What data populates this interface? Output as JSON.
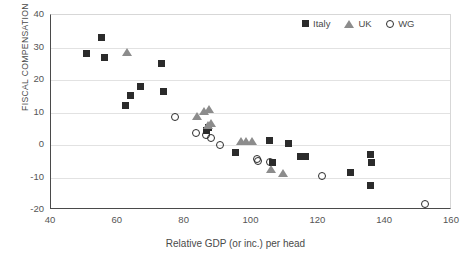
{
  "chart_data": {
    "type": "scatter",
    "title": "",
    "xlabel": "Relative GDP (or inc.) per head",
    "ylabel": "FISCAL COMPENSATION",
    "xlim": [
      40,
      160
    ],
    "ylim": [
      -20,
      40
    ],
    "xticks": [
      40,
      60,
      80,
      100,
      120,
      140,
      160
    ],
    "yticks": [
      -20,
      -10,
      0,
      10,
      20,
      30,
      40
    ],
    "grid": "horizontal",
    "legend_position": "top-right",
    "colors": {
      "italy": "#2b2b2b",
      "uk": "#8c8c8c",
      "wg": "#2b2b2b",
      "gridline": "#e2e2e2",
      "axis": "#4a4a4a"
    },
    "series": [
      {
        "name": "Italy",
        "marker": "filled-square",
        "color": "#2b2b2b",
        "points": [
          [
            50.7,
            28.3
          ],
          [
            55.2,
            33.2
          ],
          [
            55.9,
            27.0
          ],
          [
            62.3,
            12.3
          ],
          [
            63.9,
            15.1
          ],
          [
            66.8,
            18.0
          ],
          [
            73.2,
            25.1
          ],
          [
            73.8,
            16.4
          ],
          [
            86.6,
            4.6
          ],
          [
            87.2,
            5.3
          ],
          [
            95.3,
            -2.2
          ],
          [
            105.3,
            1.5
          ],
          [
            106.2,
            -5.4
          ],
          [
            111.0,
            0.5
          ],
          [
            114.6,
            -3.4
          ],
          [
            116.2,
            -3.4
          ],
          [
            129.6,
            -8.6
          ],
          [
            135.6,
            -2.9
          ],
          [
            135.8,
            -5.3
          ],
          [
            135.5,
            -12.5
          ]
        ]
      },
      {
        "name": "UK",
        "marker": "filled-triangle",
        "color": "#8c8c8c",
        "points": [
          [
            62.8,
            28.6
          ],
          [
            83.6,
            8.9
          ],
          [
            85.8,
            10.3
          ],
          [
            87.4,
            11.0
          ],
          [
            87.0,
            6.0
          ],
          [
            88.0,
            6.7
          ],
          [
            97.0,
            1.2
          ],
          [
            98.5,
            1.2
          ],
          [
            100.0,
            1.2
          ],
          [
            105.7,
            -7.6
          ],
          [
            109.3,
            -8.8
          ]
        ]
      },
      {
        "name": "WG",
        "marker": "open-circle",
        "color": "#2b2b2b",
        "points": [
          [
            77.0,
            8.7
          ],
          [
            83.5,
            3.8
          ],
          [
            86.5,
            3.0
          ],
          [
            87.8,
            2.2
          ],
          [
            90.7,
            0.0
          ],
          [
            101.5,
            -4.3
          ],
          [
            102.0,
            -5.0
          ],
          [
            105.6,
            -5.2
          ],
          [
            121.2,
            -9.6
          ],
          [
            151.8,
            -18.3
          ]
        ]
      }
    ]
  },
  "legend": {
    "items": [
      {
        "label": "Italy",
        "marker": "filled-square"
      },
      {
        "label": "UK",
        "marker": "filled-triangle"
      },
      {
        "label": "WG",
        "marker": "open-circle"
      }
    ]
  }
}
